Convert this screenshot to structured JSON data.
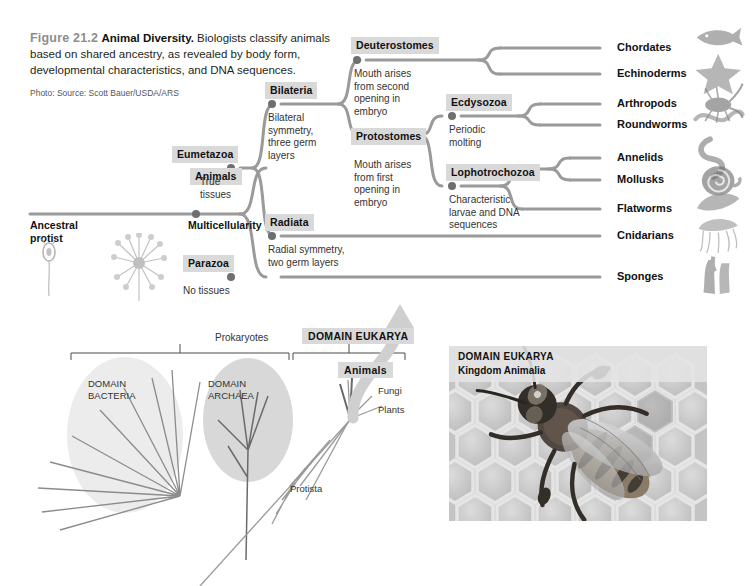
{
  "caption": {
    "figure_number": "Figure 21.2",
    "figure_title": "Animal Diversity.",
    "body": "Biologists classify animals based on shared ancestry, as revealed by body form, developmental characteristics, and DNA sequences.",
    "credit": "Photo: Source: Scott Bauer/USDA/ARS"
  },
  "tree": {
    "root_label": "Ancestral\nprotist",
    "nodes": [
      {
        "name": "Animals",
        "label": "Animals",
        "desc": "Multicellularity",
        "x": 196,
        "y": 214,
        "label_x": 190,
        "label_y": 168,
        "desc_x": 188,
        "desc_y": 219,
        "desc_bold": true
      },
      {
        "name": "Eumetazoa",
        "label": "Eumetazoa",
        "desc": "True\ntissues",
        "x": 231,
        "y": 168,
        "label_x": 172,
        "label_y": 146,
        "desc_x": 200,
        "desc_y": 176
      },
      {
        "name": "Parazoa",
        "label": "Parazoa",
        "desc": "No tissues",
        "x": 231,
        "y": 277,
        "label_x": 183,
        "label_y": 255,
        "desc_x": 183,
        "desc_y": 285
      },
      {
        "name": "Bilateria",
        "label": "Bilateria",
        "desc": "Bilateral\nsymmetry,\nthree germ\nlayers",
        "x": 272,
        "y": 104,
        "label_x": 265,
        "label_y": 82,
        "desc_x": 268,
        "desc_y": 112
      },
      {
        "name": "Radiata",
        "label": "Radiata",
        "desc": "Radial symmetry,\ntwo germ layers",
        "x": 272,
        "y": 236,
        "label_x": 265,
        "label_y": 214,
        "desc_x": 268,
        "desc_y": 244
      },
      {
        "name": "Deuterostomes",
        "label": "Deuterostomes",
        "desc": "Mouth arises\nfrom second\nopening in\nembryo",
        "x": 357,
        "y": 60,
        "label_x": 351,
        "label_y": 37,
        "desc_x": 354,
        "desc_y": 68
      },
      {
        "name": "Protostomes",
        "label": "Protostomes",
        "desc": "Mouth arises\nfrom first\nopening in\nembryo",
        "x": 357,
        "y": 135,
        "label_x": 351,
        "label_y": 128,
        "desc_x": 354,
        "desc_y": 159
      },
      {
        "name": "Ecdysozoa",
        "label": "Ecdysozoa",
        "desc": "Periodic\nmolting",
        "x": 452,
        "y": 116,
        "label_x": 446,
        "label_y": 94,
        "desc_x": 449,
        "desc_y": 124
      },
      {
        "name": "Lophotrochozoa",
        "label": "Lophotrochozoa",
        "desc": "Characteristic\nlarvae and DNA\nsequences",
        "x": 452,
        "y": 186,
        "label_x": 446,
        "label_y": 164,
        "desc_x": 449,
        "desc_y": 194
      }
    ],
    "taxa": [
      {
        "name": "Chordates",
        "label": "Chordates",
        "y": 48,
        "icon": "fish-icon"
      },
      {
        "name": "Echinoderms",
        "label": "Echinoderms",
        "y": 74,
        "icon": "starfish-icon"
      },
      {
        "name": "Arthropods",
        "label": "Arthropods",
        "y": 104,
        "icon": "crustacean-icon"
      },
      {
        "name": "Roundworms",
        "label": "Roundworms",
        "y": 125,
        "icon": "roundworm-icon"
      },
      {
        "name": "Annelids",
        "label": "Annelids",
        "y": 158,
        "icon": "earthworm-icon"
      },
      {
        "name": "Mollusks",
        "label": "Mollusks",
        "y": 180,
        "icon": "snail-icon"
      },
      {
        "name": "Flatworms",
        "label": "Flatworms",
        "y": 209,
        "icon": "flatworm-icon"
      },
      {
        "name": "Cnidarians",
        "label": "Cnidarians",
        "y": 236,
        "icon": "jellyfish-icon"
      },
      {
        "name": "Sponges",
        "label": "Sponges",
        "y": 277,
        "icon": "sponge-icon"
      }
    ]
  },
  "lower_tree": {
    "prokaryotes_label": "Prokaryotes",
    "domain_eukarya_label": "DOMAIN EUKARYA",
    "domain_bacteria_label": "DOMAIN\nBACTERIA",
    "domain_archaea_label": "DOMAIN\nARCHAEA",
    "animals_label": "Animals",
    "fungi_label": "Fungi",
    "plants_label": "Plants",
    "protista_label": "Protista"
  },
  "photo": {
    "caption_line1": "DOMAIN EUKARYA",
    "caption_line2": "Kingdom Animalia",
    "subject": "honeybee-on-honeycomb"
  },
  "colors": {
    "branch": "#9a9a9a",
    "node_dot": "#6f6f6f",
    "label_highlight": "#d9d9d9",
    "text": "#231f20",
    "arrow": "#c9c9c9"
  }
}
